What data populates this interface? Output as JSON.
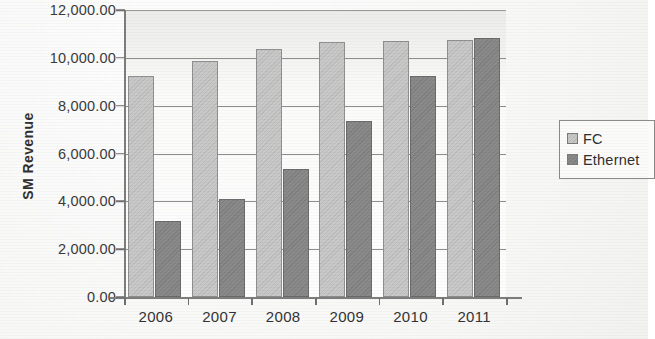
{
  "chart_data": {
    "type": "bar",
    "title": "",
    "xlabel": "",
    "ylabel": "SM Revenue",
    "categories": [
      "2006",
      "2007",
      "2008",
      "2009",
      "2010",
      "2011"
    ],
    "series": [
      {
        "name": "FC",
        "color": "#c9c9c9",
        "values": [
          9250,
          9850,
          10350,
          10650,
          10700,
          10750
        ]
      },
      {
        "name": "Ethernet",
        "color": "#8a8a8a",
        "values": [
          3180,
          4100,
          5350,
          7350,
          9250,
          10850
        ]
      }
    ],
    "ylim": [
      0,
      12000
    ],
    "ytick_values": [
      0,
      2000,
      4000,
      6000,
      8000,
      10000,
      12000
    ],
    "ytick_labels": [
      "0.00",
      "2,000.00",
      "4,000.00",
      "6,000.00",
      "8,000.00",
      "10,000.00",
      "12,000.00"
    ],
    "grid": true,
    "legend_position": "right"
  },
  "legend": {
    "entries": [
      {
        "label": "FC",
        "swatch": "fc"
      },
      {
        "label": "Ethernet",
        "swatch": "ethernet"
      }
    ]
  }
}
